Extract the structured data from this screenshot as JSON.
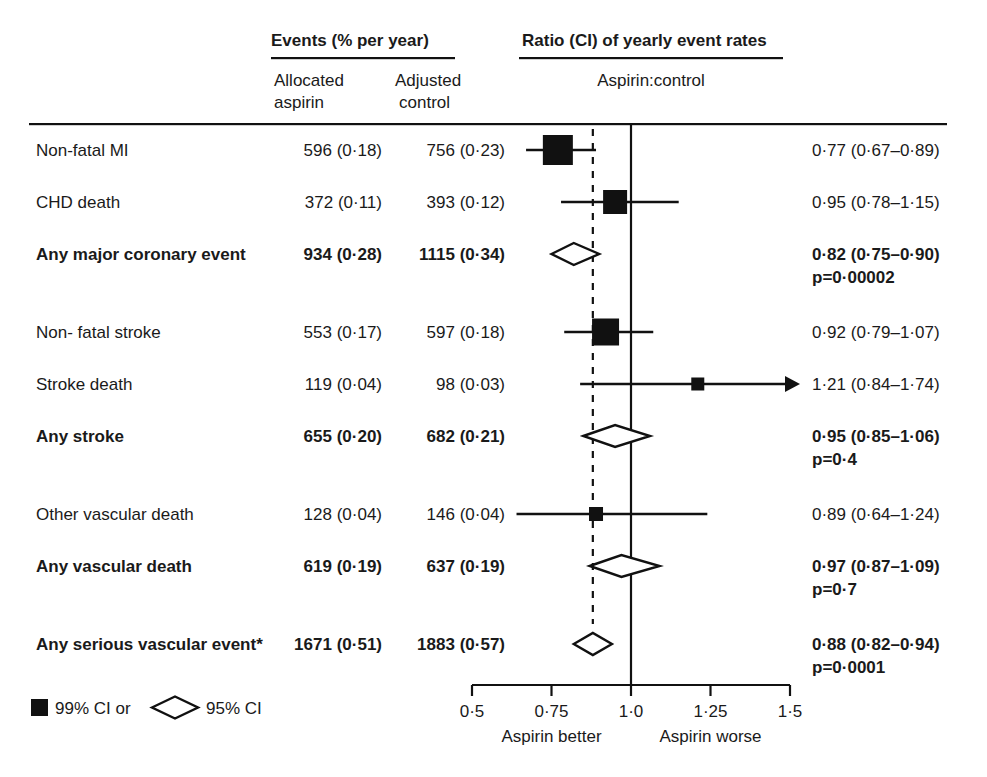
{
  "header": {
    "events_title": "Events (% per year)",
    "col_aspirin_line1": "Allocated",
    "col_aspirin_line2": "aspirin",
    "col_control_line1": "Adjusted",
    "col_control_line2": "control",
    "ratio_title": "Ratio (CI) of yearly event rates",
    "ratio_subtitle": "Aspirin:control"
  },
  "legend": {
    "square_label": "99% CI or",
    "diamond_label": "95% CI"
  },
  "axis": {
    "ticks": [
      "0·5",
      "0·75",
      "1·0",
      "1·25",
      "1·5"
    ],
    "tick_values": [
      0.5,
      0.75,
      1.0,
      1.25,
      1.5
    ],
    "left_label": "Aspirin better",
    "right_label": "Aspirin worse",
    "reference_line": 1.0,
    "dashed_reference": 0.88
  },
  "chart_data": {
    "type": "forest",
    "title": "Ratio (CI) of yearly event rates",
    "xlabel": "Aspirin:control",
    "xlim": [
      0.5,
      1.5
    ],
    "ticks": [
      0.5,
      0.75,
      1.0,
      1.25,
      1.5
    ],
    "reference_line": 1.0,
    "dashed_reference": 0.88,
    "columns": [
      "Allocated aspirin",
      "Adjusted control",
      "Ratio (CI)"
    ],
    "rows": [
      {
        "label": "Non-fatal MI",
        "bold": false,
        "marker": "square",
        "aspirin": "596 (0·18)",
        "control": "756 (0·23)",
        "aspirin_n": 596,
        "aspirin_pct": 0.18,
        "control_n": 756,
        "control_pct": 0.23,
        "ratio_text": "0·77 (0·67–0·89)",
        "ratio": 0.77,
        "ci_low": 0.67,
        "ci_high": 0.89,
        "size": 30,
        "arrow": false,
        "p": null,
        "gap_before": 0
      },
      {
        "label": "CHD death",
        "bold": false,
        "marker": "square",
        "aspirin": "372 (0·11)",
        "control": "393 (0·12)",
        "aspirin_n": 372,
        "aspirin_pct": 0.11,
        "control_n": 393,
        "control_pct": 0.12,
        "ratio_text": "0·95 (0·78–1·15)",
        "ratio": 0.95,
        "ci_low": 0.78,
        "ci_high": 1.15,
        "size": 24,
        "arrow": false,
        "p": null,
        "gap_before": 0
      },
      {
        "label": "Any major coronary event",
        "bold": true,
        "marker": "diamond",
        "aspirin": "934 (0·28)",
        "control": "1115 (0·34)",
        "aspirin_n": 934,
        "aspirin_pct": 0.28,
        "control_n": 1115,
        "control_pct": 0.34,
        "ratio_text": "0·82 (0·75–0·90)",
        "ratio": 0.82,
        "ci_low": 0.75,
        "ci_high": 0.9,
        "size": 0,
        "arrow": false,
        "p": "p=0·00002",
        "gap_before": 0
      },
      {
        "label": "Non- fatal stroke",
        "bold": false,
        "marker": "square",
        "aspirin": "553 (0·17)",
        "control": "597 (0·18)",
        "aspirin_n": 553,
        "aspirin_pct": 0.17,
        "control_n": 597,
        "control_pct": 0.18,
        "ratio_text": "0·92 (0·79–1·07)",
        "ratio": 0.92,
        "ci_low": 0.79,
        "ci_high": 1.07,
        "size": 27,
        "arrow": false,
        "p": null,
        "gap_before": 1
      },
      {
        "label": "Stroke death",
        "bold": false,
        "marker": "square",
        "aspirin": "119 (0·04)",
        "control": "98 (0·03)",
        "aspirin_n": 119,
        "aspirin_pct": 0.04,
        "control_n": 98,
        "control_pct": 0.03,
        "ratio_text": "1·21 (0·84–1·74)",
        "ratio": 1.21,
        "ci_low": 0.84,
        "ci_high": 1.74,
        "size": 13,
        "arrow": true,
        "p": null,
        "gap_before": 0
      },
      {
        "label": "Any stroke",
        "bold": true,
        "marker": "diamond",
        "aspirin": "655 (0·20)",
        "control": "682 (0·21)",
        "aspirin_n": 655,
        "aspirin_pct": 0.2,
        "control_n": 682,
        "control_pct": 0.21,
        "ratio_text": "0·95 (0·85–1·06)",
        "ratio": 0.95,
        "ci_low": 0.85,
        "ci_high": 1.06,
        "size": 0,
        "arrow": false,
        "p": "p=0·4",
        "gap_before": 0
      },
      {
        "label": "Other vascular death",
        "bold": false,
        "marker": "square",
        "aspirin": "128 (0·04)",
        "control": "146 (0·04)",
        "aspirin_n": 128,
        "aspirin_pct": 0.04,
        "control_n": 146,
        "control_pct": 0.04,
        "ratio_text": "0·89 (0·64–1·24)",
        "ratio": 0.89,
        "ci_low": 0.64,
        "ci_high": 1.24,
        "size": 14,
        "arrow": false,
        "p": null,
        "gap_before": 1
      },
      {
        "label": "Any vascular death",
        "bold": true,
        "marker": "diamond",
        "aspirin": "619 (0·19)",
        "control": "637 (0·19)",
        "aspirin_n": 619,
        "aspirin_pct": 0.19,
        "control_n": 637,
        "control_pct": 0.19,
        "ratio_text": "0·97 (0·87–1·09)",
        "ratio": 0.97,
        "ci_low": 0.87,
        "ci_high": 1.09,
        "size": 0,
        "arrow": false,
        "p": "p=0·7",
        "gap_before": 0
      },
      {
        "label": "Any serious vascular event*",
        "bold": true,
        "marker": "diamond",
        "aspirin": "1671 (0·51)",
        "control": "1883 (0·57)",
        "aspirin_n": 1671,
        "aspirin_pct": 0.51,
        "control_n": 1883,
        "control_pct": 0.57,
        "ratio_text": "0·88 (0·82–0·94)",
        "ratio": 0.88,
        "ci_low": 0.82,
        "ci_high": 0.94,
        "size": 0,
        "arrow": false,
        "p": "p=0·0001",
        "gap_before": 1
      }
    ]
  }
}
